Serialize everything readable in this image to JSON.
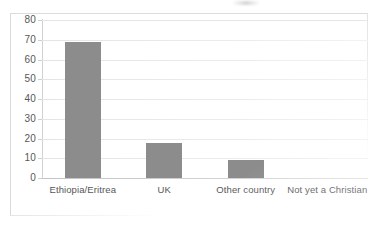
{
  "chart_data": {
    "type": "bar",
    "title": "",
    "subtitle": "",
    "xlabel": "",
    "ylabel": "",
    "categories": [
      "Ethiopia/Eritrea",
      "UK",
      "Other country",
      "Not yet a Christian"
    ],
    "values": [
      69,
      17.5,
      9,
      0
    ],
    "ylim": [
      0,
      80
    ],
    "ytick_labels": [
      "80",
      "70",
      "60",
      "50",
      "40",
      "30",
      "20",
      "10",
      "0"
    ],
    "ytick_values": [
      80,
      70,
      60,
      50,
      40,
      30,
      20,
      10,
      0
    ],
    "ytick_step": 10,
    "grid": true,
    "grid_axis": "y",
    "legend": false,
    "legend_position": "none",
    "bar_color": "#8c8c8c",
    "gridline_color": "#e6e6e6",
    "axis_color": "#d2d2d2",
    "text_color": "#565656",
    "background": "#ffffff",
    "annotations": []
  },
  "figure": {
    "frame_visible": true,
    "title_remnant_present": true
  }
}
